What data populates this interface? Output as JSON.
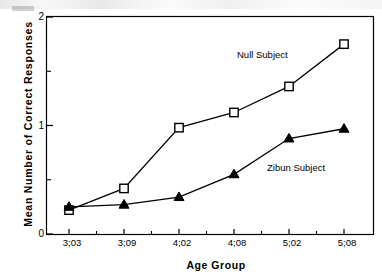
{
  "chart_data": {
    "type": "line",
    "title": "",
    "xlabel": "Age Group",
    "ylabel": "Mean Number  of  Correct  Responses",
    "categories": [
      "3;03",
      "3;09",
      "4;02",
      "4;08",
      "5;02",
      "5;08"
    ],
    "ylim": [
      0,
      2
    ],
    "yticks": [
      0,
      1,
      2
    ],
    "ytick_labels": [
      "0",
      "1",
      "2"
    ],
    "yminor_ticks": [
      0.5,
      1.5
    ],
    "grid": false,
    "legend_position": "inline-annotation",
    "series": [
      {
        "name": "Null Subject",
        "marker": "open-square",
        "values": [
          0.22,
          0.42,
          0.98,
          1.12,
          1.36,
          1.75
        ]
      },
      {
        "name": "Zibun Subject",
        "marker": "filled-triangle",
        "values": [
          0.25,
          0.27,
          0.34,
          0.55,
          0.88,
          0.97
        ]
      }
    ],
    "annotations": [
      {
        "text": "Null Subject",
        "x_px": 237,
        "y_px": 56
      },
      {
        "text": "Zibun Subject",
        "x_px": 267,
        "y_px": 169
      }
    ]
  },
  "colors": {
    "line": "#000000",
    "axis": "#000000",
    "background": "#ffffff",
    "marker_fill_open": "#ffffff",
    "marker_fill_solid": "#000000"
  }
}
